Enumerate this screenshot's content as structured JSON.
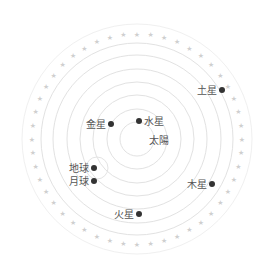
{
  "diagram": {
    "title": "",
    "center": {
      "x": 137,
      "y": 139
    },
    "sun": {
      "label": "太陽",
      "x": 149,
      "y": 144
    },
    "orbit_radii": [
      17,
      30,
      44,
      57,
      70,
      84,
      96
    ],
    "outer_ring_radius": 115,
    "star_ring_radius": 105,
    "star_count": 48,
    "colors": {
      "planet": "#333333",
      "orbit": "#e2e2e2",
      "label": "#555555",
      "star": "#cfcfcf"
    },
    "bodies": [
      {
        "name": "水星",
        "x": 139,
        "y": 121,
        "label_side": "right"
      },
      {
        "name": "金星",
        "x": 111,
        "y": 124,
        "label_side": "left"
      },
      {
        "name": "地球",
        "x": 94,
        "y": 168,
        "label_side": "left"
      },
      {
        "name": "月球",
        "x": 94,
        "y": 181,
        "label_side": "left"
      },
      {
        "name": "火星",
        "x": 139,
        "y": 214,
        "label_side": "left"
      },
      {
        "name": "木星",
        "x": 212,
        "y": 184,
        "label_side": "left"
      },
      {
        "name": "土星",
        "x": 222,
        "y": 90,
        "label_side": "left"
      }
    ],
    "moon_orbit": {
      "cx": 97,
      "cy": 168,
      "r": 11
    }
  }
}
